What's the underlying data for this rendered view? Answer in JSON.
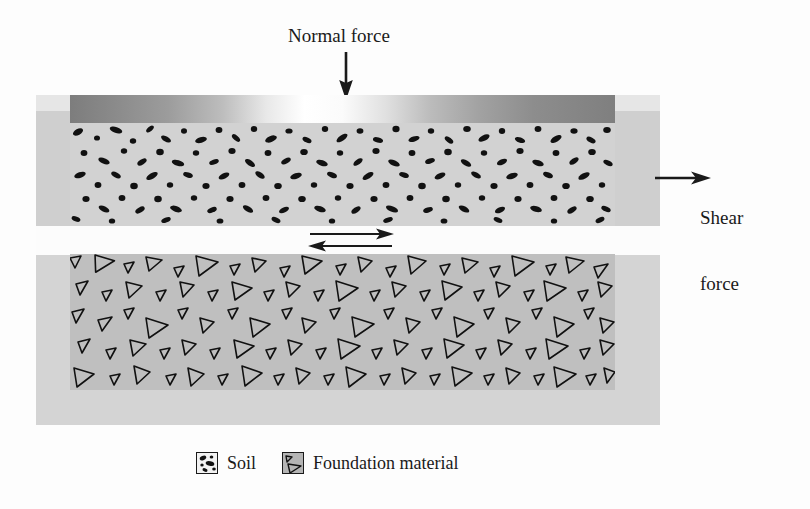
{
  "figure": {
    "type": "direct-shear-test-schematic"
  },
  "labels": {
    "normal_force": "Normal force",
    "shear_force_line1": "Shear",
    "shear_force_line2": "force"
  },
  "annotations": {
    "normal_force_arrow": "downward-arrow",
    "shear_force_arrow": "rightward-arrow",
    "shear_plane_arrows": "opposed-horizontal-double-arrow"
  },
  "legend": {
    "items": [
      {
        "key": "soil",
        "label": "Soil",
        "swatch": "soil-speckle-swatch"
      },
      {
        "key": "foundation",
        "label": "Foundation material",
        "swatch": "foundation-triangle-swatch"
      }
    ]
  },
  "colors": {
    "outer_box": "#cfcfcf",
    "outer_box_lower": "#d4d4d4",
    "soil_fill": "#d2d2d2",
    "soil_particles": "#101010",
    "foundation_fill": "#bfbfbf",
    "foundation_particles": "#101010",
    "plate_dark": "#7d7d7d",
    "plate_highlight": "#ffffff",
    "gap": "#fcfcfc",
    "ink": "#1a1a1a"
  }
}
